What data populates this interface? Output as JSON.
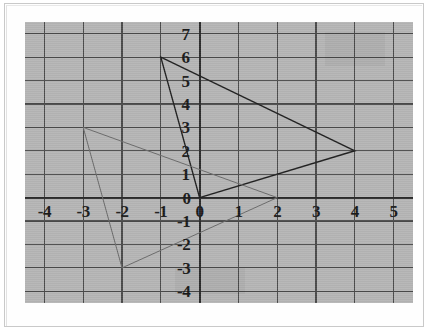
{
  "figure": {
    "title": "",
    "background_color": "#b5b5b5",
    "grid_color": "#4a4a4a",
    "axis_color": "#2b2b2b"
  },
  "chart_data": {
    "type": "scatter",
    "title": "",
    "xlabel": "",
    "ylabel": "",
    "xlim": [
      -4.5,
      5.5
    ],
    "ylim": [
      -4.5,
      7.5
    ],
    "grid": true,
    "legend": "none",
    "x_ticks": [
      -4,
      -3,
      -2,
      -1,
      0,
      1,
      2,
      3,
      4,
      5
    ],
    "x_tick_labels": [
      "-4",
      "-3",
      "-2",
      "-1",
      "0",
      "1",
      "2",
      "3",
      "4",
      "5"
    ],
    "y_ticks": [
      7,
      6,
      5,
      4,
      3,
      2,
      1,
      0,
      -1,
      -2,
      -3,
      -4
    ],
    "y_tick_labels": [
      "7",
      "6",
      "5",
      "4",
      "3",
      "2",
      "1",
      "0",
      "-1",
      "-2",
      "-3",
      "-4"
    ],
    "series": [
      {
        "name": "triangle-dark",
        "type": "polygon",
        "color": "#1f1f1f",
        "linewidth": 1.4,
        "closed": true,
        "points": [
          {
            "x": -1,
            "y": 6
          },
          {
            "x": 4,
            "y": 2
          },
          {
            "x": 0,
            "y": 0
          }
        ]
      },
      {
        "name": "triangle-light",
        "type": "polygon",
        "color": "#6a6a6a",
        "linewidth": 1.0,
        "closed": true,
        "points": [
          {
            "x": -3,
            "y": 3
          },
          {
            "x": -2,
            "y": -3
          },
          {
            "x": 2,
            "y": 0
          }
        ]
      }
    ]
  }
}
